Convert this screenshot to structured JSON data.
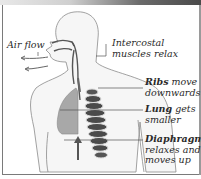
{
  "diagram": {
    "labels": {
      "airflow": "Air flow",
      "intercostal_line1": "Intercostal",
      "intercostal_line2": "muscles relax",
      "ribs_bold": "Ribs",
      "ribs_rest1": " move",
      "ribs_line2": "downwards",
      "lung_bold": "Lung",
      "lung_rest1": " gets",
      "lung_line2": "smaller",
      "diaphragm_bold": "Diaphragm",
      "diaphragm_line2": "relaxes and",
      "diaphragm_line3": "moves up"
    },
    "colors": {
      "body_outline": "#8a8a8a",
      "lung_fill": "#a8a8a8",
      "rib_dark": "#4a4a4a",
      "rib_light": "#d8d8d8",
      "text": "#2a2a2a",
      "leader_line": "#555555"
    },
    "icons": {
      "airflow_arrows": "arrow-left",
      "diaphragm_arrow": "arrow-up"
    }
  }
}
